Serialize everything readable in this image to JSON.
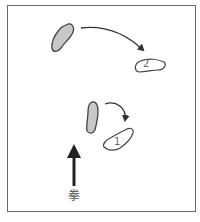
{
  "diagram": {
    "type": "footwork-diagram",
    "colors": {
      "frame": "#6a6a6a",
      "start_foot_fill": "#c8c8c8",
      "foot_stroke": "#444444",
      "arrow": "#333333",
      "direction_arrow": "#222222"
    },
    "steps": [
      {
        "number": "2",
        "description": "left foot moves from upper-left to right"
      },
      {
        "number": "1",
        "description": "right foot pivots clockwise"
      }
    ],
    "direction_label": "拳"
  }
}
